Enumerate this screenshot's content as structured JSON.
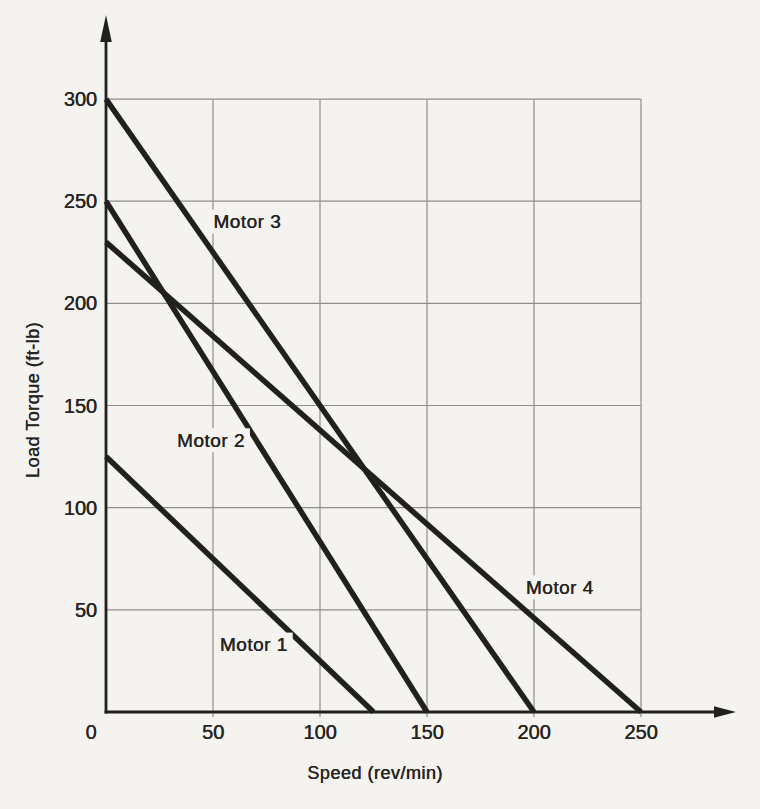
{
  "figure": {
    "background": "#f4f3f0",
    "ink_color": "#21201d",
    "grid_color": "#8f8e8a",
    "text_color": "#262421"
  },
  "chart_data": {
    "type": "line",
    "title": "",
    "xlabel": "Speed (rev/min)",
    "ylabel": "Load Torque (ft-lb)",
    "xlim": [
      0,
      250
    ],
    "ylim": [
      0,
      300
    ],
    "x_ticks": [
      0,
      50,
      100,
      150,
      200,
      250
    ],
    "y_ticks": [
      50,
      100,
      150,
      200,
      250,
      300
    ],
    "grid": true,
    "legend_position": "inline-labels",
    "series": [
      {
        "name": "Motor 1",
        "x": [
          0,
          125
        ],
        "y": [
          125,
          0
        ],
        "label_anchor": {
          "x": 69,
          "y": 33
        }
      },
      {
        "name": "Motor 2",
        "x": [
          0,
          150
        ],
        "y": [
          250,
          0
        ],
        "label_anchor": {
          "x": 49,
          "y": 133
        }
      },
      {
        "name": "Motor 3",
        "x": [
          0,
          200
        ],
        "y": [
          300,
          0
        ],
        "label_anchor": {
          "x": 66,
          "y": 240
        }
      },
      {
        "name": "Motor 4",
        "x": [
          0,
          250
        ],
        "y": [
          230,
          0
        ],
        "label_anchor": {
          "x": 212,
          "y": 61
        }
      }
    ]
  }
}
